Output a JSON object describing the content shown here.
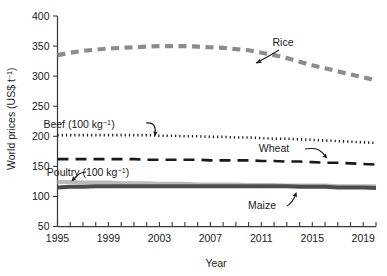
{
  "chart_data": {
    "type": "line",
    "title": "",
    "xlabel": "Year",
    "ylabel_prefix": "World prices (US$ t",
    "ylabel_sup": "−1",
    "ylabel_suffix": ")",
    "ylabel_full": "World prices (US$ t⁻¹)",
    "xlim": [
      1995,
      2020
    ],
    "ylim": [
      50,
      400
    ],
    "y_ticks": [
      50,
      100,
      150,
      200,
      250,
      300,
      350,
      400
    ],
    "y_tick_labels": [
      "50",
      "100",
      "150",
      "200",
      "250",
      "300",
      "350",
      "400"
    ],
    "x_ticks": [
      1995,
      1996,
      1997,
      1998,
      1999,
      2000,
      2001,
      2002,
      2003,
      2004,
      2005,
      2006,
      2007,
      2008,
      2009,
      2010,
      2011,
      2012,
      2013,
      2014,
      2015,
      2016,
      2017,
      2018,
      2019,
      2020
    ],
    "x_tick_labels": [
      "1995",
      "1999",
      "2003",
      "2007",
      "2011",
      "2015",
      "2019"
    ],
    "x_tick_label_values": [
      1995,
      1999,
      2003,
      2007,
      2011,
      2015,
      2019
    ],
    "grid": false,
    "legend": "inline-annotations",
    "x": [
      1995,
      1996,
      1997,
      1998,
      1999,
      2000,
      2001,
      2002,
      2003,
      2004,
      2005,
      2006,
      2007,
      2008,
      2009,
      2010,
      2011,
      2012,
      2013,
      2014,
      2015,
      2016,
      2017,
      2018,
      2019,
      2020
    ],
    "series": [
      {
        "name": "Rice",
        "color": "#8c8c8c",
        "style": "dashed-thick",
        "values": [
          335,
          339,
          342,
          344,
          346,
          347,
          348,
          349,
          350,
          350,
          350,
          349,
          348,
          347,
          345,
          343,
          339,
          335,
          330,
          324,
          318,
          313,
          308,
          303,
          298,
          293
        ]
      },
      {
        "name": "Beef (100 kg⁻¹)",
        "color": "#1a1a1a",
        "style": "dotted",
        "values": [
          202,
          202,
          202,
          202,
          202,
          202,
          202,
          202,
          201,
          201,
          200,
          200,
          199,
          199,
          198,
          198,
          197,
          196,
          196,
          195,
          194,
          193,
          192,
          191,
          190,
          189
        ]
      },
      {
        "name": "Wheat",
        "color": "#1a1a1a",
        "style": "longdash",
        "values": [
          162,
          162,
          162,
          162,
          162,
          162,
          162,
          161,
          161,
          161,
          161,
          161,
          160,
          160,
          160,
          160,
          159,
          159,
          158,
          158,
          157,
          156,
          156,
          155,
          154,
          153
        ]
      },
      {
        "name": "Poultry (100 kg⁻¹)",
        "color": "#b9b9b9",
        "style": "solid-thick",
        "values": [
          124,
          124,
          123,
          123,
          123,
          122,
          122,
          122,
          121,
          121,
          121,
          120,
          120,
          120,
          120,
          119,
          119,
          119,
          118,
          118,
          118,
          118,
          117,
          117,
          117,
          117
        ]
      },
      {
        "name": "Maize",
        "color": "#4d4d4d",
        "style": "solid-thick",
        "values": [
          115,
          116,
          116,
          117,
          117,
          117,
          117,
          117,
          117,
          117,
          117,
          117,
          117,
          117,
          117,
          117,
          117,
          117,
          117,
          116,
          116,
          116,
          115,
          115,
          115,
          114
        ]
      }
    ],
    "annotations": [
      {
        "id": "rice",
        "label": "Rice",
        "text_x": 283,
        "text_y": 46
      },
      {
        "id": "beef",
        "label": "Beef (100 kg⁻¹)",
        "text_x": 79,
        "text_y": 128
      },
      {
        "id": "wheat",
        "label": "Wheat",
        "text_x": 274,
        "text_y": 152
      },
      {
        "id": "poultry",
        "label": "Poultry (100 kg⁻¹)",
        "text_x": 88,
        "text_y": 176
      },
      {
        "id": "maize",
        "label": "Maize",
        "text_x": 262,
        "text_y": 209
      }
    ]
  }
}
